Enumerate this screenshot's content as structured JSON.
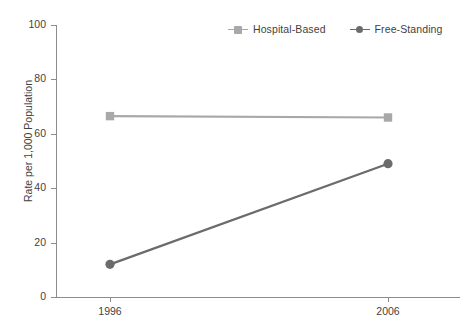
{
  "chart_data": {
    "type": "line",
    "title": "",
    "xlabel": "",
    "ylabel": "Rate per 1,000 Population",
    "categories": [
      "1996",
      "2006"
    ],
    "x": [
      1996,
      2006
    ],
    "xlim": [
      1996,
      2006
    ],
    "ylim": [
      0,
      100
    ],
    "yticks": [
      0,
      20,
      40,
      60,
      80,
      100
    ],
    "ytick_labels": [
      "0",
      "20",
      "40",
      "60",
      "80",
      "100"
    ],
    "xtick_labels": [
      "1996",
      "2006"
    ],
    "grid": false,
    "legend_position": "top-right",
    "series": [
      {
        "name": "Hospital-Based",
        "values": [
          66.5,
          66.0
        ],
        "color": "#a8a8a8",
        "marker": "square"
      },
      {
        "name": "Free-Standing",
        "values": [
          12.0,
          49.0
        ],
        "color": "#6b6b6b",
        "marker": "circle"
      }
    ]
  },
  "legend": {
    "items": [
      {
        "label": "Hospital-Based",
        "marker_icon": "square-marker-icon"
      },
      {
        "label": "Free-Standing",
        "marker_icon": "circle-marker-icon"
      }
    ]
  },
  "axes": {
    "y_title": "Rate per 1,000 Population",
    "y_labels": [
      "100",
      "80",
      "60",
      "40",
      "20",
      "0"
    ],
    "x_labels": [
      "1996",
      "2006"
    ]
  },
  "caption": {
    "text": ""
  },
  "colors": {
    "hospital_based": "#a8a8a8",
    "free_standing": "#6b6b6b",
    "axis": "#8c8c8c",
    "text": "#3f3f3f",
    "background": "#ffffff"
  }
}
